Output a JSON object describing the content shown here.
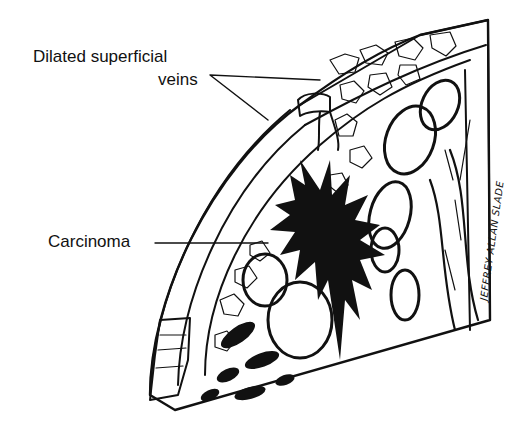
{
  "figure": {
    "labels": {
      "veins_line1": "Dilated superficial",
      "veins_line2": "veins",
      "carcinoma": "Carcinoma"
    },
    "signature": "JEFFREY ALLAN SLADE",
    "colors": {
      "ink": "#111111",
      "background": "#ffffff"
    }
  }
}
